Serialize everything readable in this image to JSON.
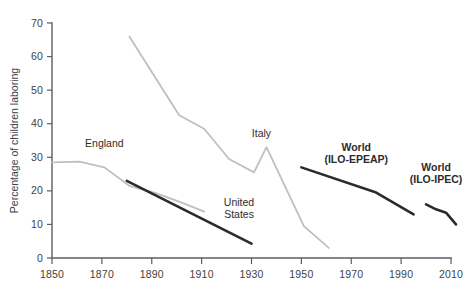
{
  "chart_data": {
    "type": "line",
    "title": "",
    "xlabel": "",
    "ylabel": "Percentage of children laboring",
    "xlim": [
      1850,
      2010
    ],
    "ylim": [
      0,
      70
    ],
    "grid": false,
    "legend": "inline-labels",
    "xticks": [
      "1850",
      "1870",
      "1890",
      "1910",
      "1930",
      "1950",
      "1970",
      "1990",
      "2010"
    ],
    "xtick_values": [
      1850,
      1870,
      1890,
      1910,
      1930,
      1950,
      1970,
      1990,
      2010
    ],
    "yticks": [
      "0",
      "10",
      "20",
      "30",
      "40",
      "50",
      "60",
      "70"
    ],
    "ytick_values": [
      0,
      10,
      20,
      30,
      40,
      50,
      60,
      70
    ],
    "series": [
      {
        "name": "England",
        "label": "England",
        "color": "#bfbfbf",
        "style": "light",
        "label_x": 1871,
        "label_y": 33,
        "x": [
          1850,
          1861,
          1871,
          1881,
          1891,
          1901,
          1911
        ],
        "values": [
          28.5,
          28.7,
          27.0,
          21.5,
          19.5,
          16.8,
          13.8
        ]
      },
      {
        "name": "United States",
        "label": "United States",
        "color": "#2b2b2b",
        "style": "dark",
        "label_x": 1925,
        "label_y": 15.5,
        "x": [
          1880,
          1930
        ],
        "values": [
          23.0,
          4.3
        ]
      },
      {
        "name": "Italy",
        "label": "Italy",
        "color": "#bfbfbf",
        "style": "light",
        "label_x": 1934,
        "label_y": 36,
        "x": [
          1881,
          1901,
          1911,
          1921,
          1931,
          1936,
          1951,
          1961
        ],
        "values": [
          66.0,
          42.5,
          38.5,
          29.5,
          25.5,
          33.0,
          9.5,
          3.0
        ]
      },
      {
        "name": "World (ILO-EPEAP)",
        "label": "World\n(ILO-EPEAP)",
        "label_line1": "World",
        "label_line2": "(ILO-EPEAP)",
        "color": "#2b2b2b",
        "style": "dark",
        "label_x": 1972,
        "label_y": 32,
        "x": [
          1950,
          1980,
          1995
        ],
        "values": [
          27.0,
          19.5,
          13.0
        ]
      },
      {
        "name": "World (ILO-IPEC)",
        "label": "World\n(ILO-IPEC)",
        "label_line1": "World",
        "label_line2": "(ILO-IPEC)",
        "color": "#2b2b2b",
        "style": "dark",
        "label_x": 2004,
        "label_y": 26,
        "x": [
          2000,
          2004,
          2008,
          2012
        ],
        "values": [
          16.0,
          14.5,
          13.5,
          10.0
        ]
      }
    ]
  },
  "axis": {
    "y_title": "Percentage of children laboring"
  }
}
